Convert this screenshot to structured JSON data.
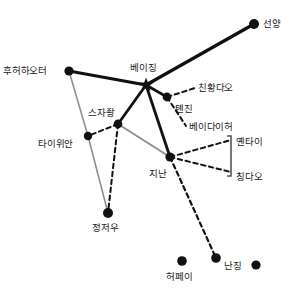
{
  "diagram": {
    "type": "network-graph",
    "title": "",
    "background_color": "#ffffff",
    "edge_styles": {
      "primary_solid_black": "#111111",
      "secondary_solid_gray": "#8f8f8f",
      "dashed_black": "#111111"
    },
    "node_color": "#111111",
    "label_color": "#1a1a1a"
  },
  "chart_data": {
    "type": "scatter",
    "title": "",
    "xlabel": "",
    "ylabel": "",
    "nodes": [
      {
        "id": "shenyang",
        "label": "선양",
        "x": 254,
        "y": 24,
        "marker": "dot",
        "r": 5.0,
        "label_dx": 9,
        "label_dy": -5
      },
      {
        "id": "hohhot",
        "label": "후허하오터",
        "x": 69,
        "y": 71,
        "marker": "dot",
        "r": 4.6,
        "label_dx": -66,
        "label_dy": -5
      },
      {
        "id": "beijing",
        "label": "베이징",
        "x": 146,
        "y": 85,
        "marker": "star",
        "r": 7.5,
        "label_dx": -16,
        "label_dy": -22
      },
      {
        "id": "tianjin",
        "label": "톈진",
        "x": 167,
        "y": 97,
        "marker": "dot",
        "r": 4.4,
        "label_dx": 8,
        "label_dy": 7
      },
      {
        "id": "qinhuangdao",
        "label": "친황다오",
        "x": 195,
        "y": 88,
        "marker": "none",
        "r": 0,
        "label_dx": 3,
        "label_dy": -5
      },
      {
        "id": "beidaihe",
        "label": "베이다이허",
        "x": 186,
        "y": 126,
        "marker": "none",
        "r": 0,
        "label_dx": 3,
        "label_dy": -4
      },
      {
        "id": "shijiazhuang",
        "label": "스자좡",
        "x": 118,
        "y": 124,
        "marker": "dot",
        "r": 4.4,
        "label_dx": -30,
        "label_dy": -16
      },
      {
        "id": "taiyuan",
        "label": "타이위안",
        "x": 88,
        "y": 136,
        "marker": "dot",
        "r": 4.2,
        "label_dx": -50,
        "label_dy": 3
      },
      {
        "id": "jinan",
        "label": "지난",
        "x": 170,
        "y": 157,
        "marker": "dot",
        "r": 4.6,
        "label_dx": -21,
        "label_dy": 12
      },
      {
        "id": "yantai",
        "label": "옌타이",
        "x": 231,
        "y": 140,
        "marker": "none",
        "r": 0,
        "label_dx": 5,
        "label_dy": -3
      },
      {
        "id": "qingdao",
        "label": "칭다오",
        "x": 231,
        "y": 172,
        "marker": "none",
        "r": 0,
        "label_dx": 5,
        "label_dy": 0
      },
      {
        "id": "zhengzhou",
        "label": "정저우",
        "x": 108,
        "y": 213,
        "marker": "dot",
        "r": 5.0,
        "label_dx": -16,
        "label_dy": 10
      },
      {
        "id": "hefei",
        "label": "허페이",
        "x": 182,
        "y": 261,
        "marker": "dot",
        "r": 4.8,
        "label_dx": -16,
        "label_dy": 11
      },
      {
        "id": "nanjing",
        "label": "난징",
        "x": 216,
        "y": 258,
        "marker": "dot",
        "r": 4.8,
        "label_dx": 8,
        "label_dy": 3
      },
      {
        "id": "unlabeled_se",
        "label": "",
        "x": 256,
        "y": 265,
        "marker": "dot",
        "r": 4.6,
        "label_dx": 0,
        "label_dy": 0
      }
    ],
    "edges": [
      {
        "from": "beijing",
        "to": "shenyang",
        "style": "primary_solid_black",
        "width": 3.2
      },
      {
        "from": "beijing",
        "to": "hohhot",
        "style": "primary_solid_black",
        "width": 3.2
      },
      {
        "from": "beijing",
        "to": "shijiazhuang",
        "style": "primary_solid_black",
        "width": 2.8
      },
      {
        "from": "beijing",
        "to": "jinan",
        "style": "primary_solid_black",
        "width": 2.8
      },
      {
        "from": "beijing",
        "to": "tianjin",
        "style": "primary_solid_black",
        "width": 2.6
      },
      {
        "from": "hohhot",
        "to": "taiyuan",
        "style": "secondary_solid_gray",
        "width": 1.6
      },
      {
        "from": "taiyuan",
        "to": "zhengzhou",
        "style": "secondary_solid_gray",
        "width": 1.6
      },
      {
        "from": "shijiazhuang",
        "to": "jinan",
        "style": "secondary_solid_gray",
        "width": 2.0
      },
      {
        "from": "shijiazhuang",
        "to": "taiyuan",
        "style": "dashed_black",
        "width": 2.0
      },
      {
        "from": "shijiazhuang",
        "to": "zhengzhou",
        "style": "dashed_black",
        "width": 2.0
      },
      {
        "from": "tianjin",
        "to": "qinhuangdao",
        "style": "dashed_black",
        "width": 2.0
      },
      {
        "from": "tianjin",
        "to": "beidaihe",
        "style": "dashed_black",
        "width": 2.0
      },
      {
        "from": "jinan",
        "to": "yantai",
        "style": "dashed_black",
        "width": 2.0
      },
      {
        "from": "jinan",
        "to": "qingdao",
        "style": "dashed_black",
        "width": 2.0
      },
      {
        "from": "jinan",
        "to": "nanjing",
        "style": "dashed_black",
        "width": 2.2
      }
    ],
    "connector_brackets": [
      {
        "id": "shandong-bracket",
        "x": 231,
        "y_top": 136,
        "y_bottom": 176,
        "color": "#555555",
        "width": 1.6
      }
    ]
  }
}
